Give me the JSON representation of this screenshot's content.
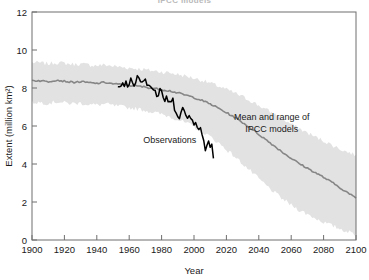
{
  "figure": {
    "title_partial": "IPCC models",
    "title_visible": false
  },
  "chart_data": {
    "type": "line",
    "title": "",
    "xlabel": "Year",
    "ylabel": "Extent (million km²)",
    "xlim": [
      1900,
      2100
    ],
    "ylim": [
      0,
      12
    ],
    "xticks": [
      1900,
      1920,
      1940,
      1960,
      1980,
      2000,
      2020,
      2040,
      2060,
      2080,
      2100
    ],
    "yticks": [
      0,
      2,
      4,
      6,
      8,
      10,
      12
    ],
    "grid": false,
    "legend_position": "inline-annotations",
    "colors": {
      "band": "#e2e2e2",
      "mean_line": "#868686",
      "observations_line": "#000000",
      "frame": "#6e6e6e",
      "text": "#1a1a1a"
    },
    "annotations": [
      {
        "name": "observations-label",
        "text": "Observations",
        "x": 1985,
        "y": 5.1
      },
      {
        "name": "ipcc-label-line1",
        "text": "Mean and range of",
        "x": 2048,
        "y": 6.3
      },
      {
        "name": "ipcc-label-line2",
        "text": "IPCC models",
        "x": 2048,
        "y": 5.7
      }
    ],
    "series": [
      {
        "name": "Mean and range of IPCC models",
        "style": "line-with-band",
        "x": [
          1900,
          1905,
          1910,
          1915,
          1920,
          1925,
          1930,
          1935,
          1940,
          1945,
          1950,
          1955,
          1960,
          1965,
          1970,
          1975,
          1980,
          1985,
          1990,
          1995,
          2000,
          2005,
          2010,
          2015,
          2020,
          2025,
          2030,
          2035,
          2040,
          2045,
          2050,
          2055,
          2060,
          2065,
          2070,
          2075,
          2080,
          2085,
          2090,
          2095,
          2100
        ],
        "values": [
          8.4,
          8.38,
          8.34,
          8.42,
          8.36,
          8.3,
          8.33,
          8.28,
          8.24,
          8.3,
          8.22,
          8.18,
          8.14,
          8.1,
          8.05,
          7.98,
          7.92,
          7.85,
          7.74,
          7.62,
          7.5,
          7.34,
          7.16,
          6.94,
          6.7,
          6.46,
          6.18,
          5.88,
          5.56,
          5.24,
          4.92,
          4.6,
          4.3,
          4.02,
          3.78,
          3.54,
          3.3,
          3.04,
          2.76,
          2.48,
          2.2
        ],
        "band_upper": [
          9.35,
          9.32,
          9.28,
          9.34,
          9.3,
          9.25,
          9.26,
          9.22,
          9.18,
          9.22,
          9.15,
          9.1,
          9.06,
          9.02,
          8.96,
          8.9,
          8.85,
          8.8,
          8.72,
          8.62,
          8.52,
          8.4,
          8.26,
          8.1,
          7.92,
          7.74,
          7.54,
          7.32,
          7.08,
          6.84,
          6.6,
          6.34,
          6.1,
          5.86,
          5.64,
          5.42,
          5.22,
          5.0,
          4.8,
          4.62,
          4.48
        ],
        "band_lower": [
          7.25,
          7.24,
          7.2,
          7.28,
          7.22,
          7.18,
          7.2,
          7.14,
          7.1,
          7.16,
          7.08,
          7.02,
          6.96,
          6.9,
          6.82,
          6.72,
          6.62,
          6.5,
          6.34,
          6.16,
          5.96,
          5.72,
          5.44,
          5.12,
          4.76,
          4.4,
          4.02,
          3.62,
          3.22,
          2.84,
          2.48,
          2.14,
          1.84,
          1.58,
          1.36,
          1.14,
          0.94,
          0.76,
          0.6,
          0.44,
          0.3
        ]
      },
      {
        "name": "Observations",
        "style": "line",
        "x": [
          1953,
          1955,
          1957,
          1959,
          1961,
          1963,
          1965,
          1967,
          1969,
          1971,
          1973,
          1975,
          1977,
          1979,
          1981,
          1983,
          1985,
          1987,
          1989,
          1991,
          1993,
          1995,
          1997,
          1999,
          2001,
          2003,
          2005,
          2007,
          2009,
          2011,
          2012
        ],
        "values": [
          8.2,
          8.05,
          8.35,
          8.1,
          8.5,
          8.3,
          8.75,
          8.4,
          8.6,
          8.35,
          8.15,
          7.95,
          7.6,
          7.85,
          7.35,
          7.55,
          7.1,
          7.3,
          6.85,
          6.6,
          6.9,
          6.4,
          6.55,
          6.25,
          6.35,
          6.0,
          5.55,
          4.6,
          5.35,
          4.9,
          4.3
        ]
      }
    ]
  }
}
